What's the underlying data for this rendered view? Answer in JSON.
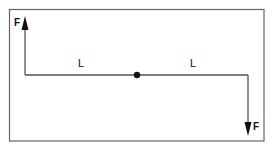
{
  "diagram": {
    "type": "force-couple",
    "colors": {
      "line": "#555555",
      "ink": "#111111",
      "frame": "#666666",
      "background": "#ffffff"
    },
    "forces": [
      {
        "id": "force-left",
        "label": "F",
        "direction": "up"
      },
      {
        "id": "force-right",
        "label": "F",
        "direction": "down"
      }
    ],
    "segments": [
      {
        "id": "arm-left",
        "label": "L"
      },
      {
        "id": "arm-right",
        "label": "L"
      }
    ],
    "pivot": {
      "id": "pivot",
      "shape": "dot"
    }
  }
}
